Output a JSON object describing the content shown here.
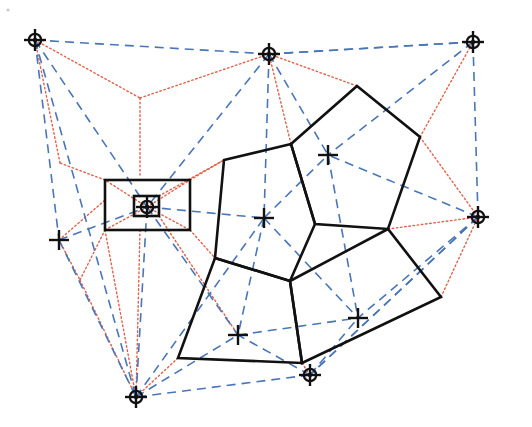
{
  "figure": {
    "caption": "",
    "width": 532,
    "height": 427,
    "background_color": "#ffffff"
  },
  "legend": {
    "delaunay_label": "Delaunay edge (blue dashed)",
    "voronoi_label": "Voronoi edge (red dotted)",
    "cell_label": "Highlighted cell boundary (black solid)",
    "site_ring_label": "Boundary site (circled cross)",
    "site_cross_label": "Interior site (cross)"
  },
  "colors": {
    "delaunay": "#4a76b8",
    "voronoi": "#e2614a",
    "cell": "#111111",
    "marker": "#111111",
    "background": "#ffffff"
  },
  "chart_data": {
    "type": "scatter",
    "xlabel": "",
    "ylabel": "",
    "xlim": [
      0,
      532
    ],
    "ylim": [
      0,
      427
    ],
    "grid": false,
    "legend_position": "none",
    "sites": [
      {
        "id": "S1",
        "label": "top-left-site",
        "x": 35,
        "y": 40,
        "marker": "circled-cross",
        "type": "boundary"
      },
      {
        "id": "S2",
        "label": "top-center-site",
        "x": 269,
        "y": 54,
        "marker": "circled-cross",
        "type": "boundary"
      },
      {
        "id": "S3",
        "label": "top-right-site",
        "x": 473,
        "y": 42,
        "marker": "circled-cross",
        "type": "boundary"
      },
      {
        "id": "S4",
        "label": "right-site",
        "x": 478,
        "y": 217,
        "marker": "circled-cross",
        "type": "boundary"
      },
      {
        "id": "S5",
        "label": "bottom-center-site",
        "x": 310,
        "y": 375,
        "marker": "circled-cross",
        "type": "boundary"
      },
      {
        "id": "S6",
        "label": "bottom-left-site",
        "x": 136,
        "y": 397,
        "marker": "circled-cross",
        "type": "boundary"
      },
      {
        "id": "S7",
        "label": "left-site",
        "x": 59,
        "y": 240,
        "marker": "cross",
        "type": "boundary"
      },
      {
        "id": "S8",
        "label": "boxed-site",
        "x": 147,
        "y": 207,
        "marker": "circled-cross",
        "type": "boxed"
      },
      {
        "id": "S9",
        "label": "interior-site-a",
        "x": 264,
        "y": 218,
        "marker": "cross",
        "type": "interior"
      },
      {
        "id": "S10",
        "label": "interior-site-b",
        "x": 328,
        "y": 155,
        "marker": "cross",
        "type": "interior"
      },
      {
        "id": "S11",
        "label": "interior-site-c",
        "x": 238,
        "y": 335,
        "marker": "cross",
        "type": "interior"
      },
      {
        "id": "S12",
        "label": "interior-site-d",
        "x": 358,
        "y": 318,
        "marker": "cross",
        "type": "interior"
      }
    ],
    "delaunay_edges": [
      [
        "S1",
        "S2"
      ],
      [
        "S2",
        "S3"
      ],
      [
        "S1",
        "S7"
      ],
      [
        "S7",
        "S6"
      ],
      [
        "S3",
        "S4"
      ],
      [
        "S4",
        "S5"
      ],
      [
        "S5",
        "S6"
      ],
      [
        "S1",
        "S8"
      ],
      [
        "S7",
        "S8"
      ],
      [
        "S2",
        "S8"
      ],
      [
        "S2",
        "S9"
      ],
      [
        "S2",
        "S10"
      ],
      [
        "S3",
        "S10"
      ],
      [
        "S4",
        "S10"
      ],
      [
        "S9",
        "S10"
      ],
      [
        "S8",
        "S9"
      ],
      [
        "S8",
        "S11"
      ],
      [
        "S6",
        "S11"
      ],
      [
        "S6",
        "S8"
      ],
      [
        "S9",
        "S11"
      ],
      [
        "S9",
        "S12"
      ],
      [
        "S10",
        "S12"
      ],
      [
        "S4",
        "S12"
      ],
      [
        "S11",
        "S12"
      ],
      [
        "S5",
        "S11"
      ],
      [
        "S5",
        "S12"
      ],
      [
        "S4",
        "S5"
      ],
      [
        "S6",
        "S9"
      ],
      [
        "S1",
        "S6"
      ],
      [
        "S3",
        "S2"
      ]
    ],
    "voronoi_vertices": [
      {
        "id": "V1",
        "x": 140,
        "y": 98
      },
      {
        "id": "V2",
        "x": 105,
        "y": 180
      },
      {
        "id": "V3",
        "x": 190,
        "y": 180
      },
      {
        "id": "V4",
        "x": 190,
        "y": 230
      },
      {
        "id": "V5",
        "x": 105,
        "y": 230
      },
      {
        "id": "V6",
        "x": 134,
        "y": 196
      },
      {
        "id": "V7",
        "x": 159,
        "y": 196
      },
      {
        "id": "V8",
        "x": 159,
        "y": 216
      },
      {
        "id": "V9",
        "x": 134,
        "y": 216
      },
      {
        "id": "V10",
        "x": 224,
        "y": 160
      },
      {
        "id": "V11",
        "x": 291,
        "y": 144
      },
      {
        "id": "V12",
        "x": 315,
        "y": 224
      },
      {
        "id": "V13",
        "x": 290,
        "y": 281
      },
      {
        "id": "V14",
        "x": 215,
        "y": 258
      },
      {
        "id": "V15",
        "x": 357,
        "y": 86
      },
      {
        "id": "V16",
        "x": 420,
        "y": 137
      },
      {
        "id": "V17",
        "x": 388,
        "y": 229
      },
      {
        "id": "V18",
        "x": 178,
        "y": 358
      },
      {
        "id": "V19",
        "x": 302,
        "y": 363
      },
      {
        "id": "V20",
        "x": 441,
        "y": 297
      }
    ],
    "cell_polygons": [
      {
        "name": "cell-around-interior-site-a",
        "site": "S9",
        "points": [
          [
            224,
            160
          ],
          [
            291,
            144
          ],
          [
            315,
            224
          ],
          [
            290,
            281
          ],
          [
            215,
            258
          ]
        ]
      },
      {
        "name": "cell-around-interior-site-b",
        "site": "S10",
        "points": [
          [
            357,
            86
          ],
          [
            420,
            137
          ],
          [
            388,
            229
          ],
          [
            315,
            224
          ],
          [
            291,
            144
          ]
        ]
      },
      {
        "name": "cell-around-interior-site-c",
        "site": "S11",
        "points": [
          [
            215,
            258
          ],
          [
            290,
            281
          ],
          [
            302,
            363
          ],
          [
            178,
            358
          ]
        ]
      },
      {
        "name": "cell-around-interior-site-d",
        "site": "S12",
        "points": [
          [
            290,
            281
          ],
          [
            388,
            229
          ],
          [
            441,
            297
          ],
          [
            302,
            363
          ]
        ]
      }
    ],
    "boxes": [
      {
        "name": "outer-box-around-boxed-site",
        "x": 105,
        "y": 180,
        "width": 85,
        "height": 50
      },
      {
        "name": "inner-box-around-boxed-site",
        "x": 134,
        "y": 196,
        "width": 25,
        "height": 20
      }
    ],
    "voronoi_edge_paths": [
      [
        [
          35,
          40
        ],
        [
          140,
          98
        ]
      ],
      [
        [
          140,
          98
        ],
        [
          269,
          54
        ]
      ],
      [
        [
          140,
          98
        ],
        [
          140,
          175
        ]
      ],
      [
        [
          105,
          180
        ],
        [
          60,
          163
        ]
      ],
      [
        [
          60,
          163
        ],
        [
          35,
          40
        ]
      ],
      [
        [
          59,
          240
        ],
        [
          105,
          200
        ]
      ],
      [
        [
          59,
          240
        ],
        [
          80,
          280
        ]
      ],
      [
        [
          80,
          280
        ],
        [
          105,
          230
        ]
      ],
      [
        [
          80,
          280
        ],
        [
          136,
          397
        ]
      ],
      [
        [
          105,
          230
        ],
        [
          136,
          397
        ]
      ],
      [
        [
          140,
          230
        ],
        [
          136,
          397
        ]
      ],
      [
        [
          159,
          216
        ],
        [
          238,
          335
        ]
      ],
      [
        [
          159,
          196
        ],
        [
          224,
          160
        ]
      ],
      [
        [
          190,
          180
        ],
        [
          224,
          160
        ]
      ],
      [
        [
          190,
          230
        ],
        [
          215,
          258
        ]
      ],
      [
        [
          224,
          160
        ],
        [
          291,
          144
        ]
      ],
      [
        [
          291,
          144
        ],
        [
          357,
          86
        ]
      ],
      [
        [
          357,
          86
        ],
        [
          269,
          54
        ]
      ],
      [
        [
          291,
          144
        ],
        [
          269,
          54
        ]
      ],
      [
        [
          420,
          137
        ],
        [
          473,
          42
        ]
      ],
      [
        [
          420,
          137
        ],
        [
          357,
          86
        ]
      ],
      [
        [
          420,
          137
        ],
        [
          478,
          217
        ]
      ],
      [
        [
          388,
          229
        ],
        [
          478,
          217
        ]
      ],
      [
        [
          388,
          229
        ],
        [
          315,
          224
        ]
      ],
      [
        [
          315,
          224
        ],
        [
          291,
          144
        ]
      ],
      [
        [
          315,
          224
        ],
        [
          290,
          281
        ]
      ],
      [
        [
          290,
          281
        ],
        [
          215,
          258
        ]
      ],
      [
        [
          215,
          258
        ],
        [
          224,
          160
        ]
      ],
      [
        [
          290,
          281
        ],
        [
          302,
          363
        ]
      ],
      [
        [
          302,
          363
        ],
        [
          310,
          375
        ]
      ],
      [
        [
          302,
          363
        ],
        [
          178,
          358
        ]
      ],
      [
        [
          178,
          358
        ],
        [
          136,
          397
        ]
      ],
      [
        [
          178,
          358
        ],
        [
          215,
          258
        ]
      ],
      [
        [
          441,
          297
        ],
        [
          388,
          229
        ]
      ],
      [
        [
          441,
          297
        ],
        [
          478,
          217
        ]
      ],
      [
        [
          441,
          297
        ],
        [
          302,
          363
        ]
      ],
      [
        [
          147,
          207
        ],
        [
          105,
          180
        ]
      ],
      [
        [
          147,
          207
        ],
        [
          190,
          180
        ]
      ],
      [
        [
          147,
          207
        ],
        [
          190,
          230
        ]
      ],
      [
        [
          147,
          207
        ],
        [
          105,
          230
        ]
      ]
    ]
  }
}
